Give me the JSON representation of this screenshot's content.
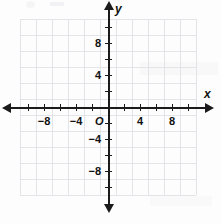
{
  "figure": {
    "kind": "cartesian-coordinate-plane",
    "background_color": "#fdfdfd",
    "grid_color": "#e2e4e8",
    "axis_color": "#1b1b1b",
    "label_color": "#111111"
  },
  "axes": {
    "x_name": "x",
    "y_name": "y",
    "origin_label": "O"
  },
  "chart_data": {
    "type": "scatter",
    "title": "",
    "subtitle": "",
    "xlabel": "x",
    "ylabel": "y",
    "origin_label": "O",
    "xlim": [
      -11,
      11
    ],
    "ylim": [
      -11,
      11
    ],
    "grid": true,
    "grid_spacing": 2,
    "tick_spacing": 2,
    "legend": false,
    "legend_position": "none",
    "x_tick_values": [
      -10,
      -8,
      -6,
      -4,
      -2,
      0,
      2,
      4,
      6,
      8,
      10
    ],
    "y_tick_values": [
      -10,
      -8,
      -6,
      -4,
      -2,
      0,
      2,
      4,
      6,
      8,
      10
    ],
    "x_labeled_ticks": [
      {
        "value": -8,
        "label": "−8"
      },
      {
        "value": -4,
        "label": "−4"
      },
      {
        "value": 4,
        "label": "4"
      },
      {
        "value": 8,
        "label": "8"
      }
    ],
    "y_labeled_ticks": [
      {
        "value": 8,
        "label": "8"
      },
      {
        "value": 4,
        "label": "4"
      },
      {
        "value": -4,
        "label": "−4"
      },
      {
        "value": -8,
        "label": "−8"
      }
    ],
    "series": [],
    "annotations": []
  }
}
